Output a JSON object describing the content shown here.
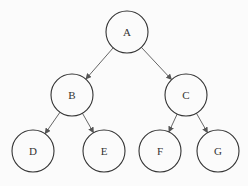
{
  "diagram": {
    "type": "binary-tree",
    "nodes": [
      {
        "id": "A",
        "label": "A",
        "cx": 127,
        "cy": 32
      },
      {
        "id": "B",
        "label": "B",
        "cx": 72,
        "cy": 95
      },
      {
        "id": "C",
        "label": "C",
        "cx": 186,
        "cy": 95
      },
      {
        "id": "D",
        "label": "D",
        "cx": 33,
        "cy": 151
      },
      {
        "id": "E",
        "label": "E",
        "cx": 104,
        "cy": 151
      },
      {
        "id": "F",
        "label": "F",
        "cx": 160,
        "cy": 151
      },
      {
        "id": "G",
        "label": "G",
        "cx": 218,
        "cy": 151
      }
    ],
    "edges": [
      {
        "from": "A",
        "to": "B"
      },
      {
        "from": "A",
        "to": "C"
      },
      {
        "from": "B",
        "to": "D"
      },
      {
        "from": "B",
        "to": "E"
      },
      {
        "from": "C",
        "to": "F"
      },
      {
        "from": "C",
        "to": "G"
      }
    ],
    "node_radius": 21,
    "stroke_color": "#333333",
    "edge_color": "#555555"
  }
}
